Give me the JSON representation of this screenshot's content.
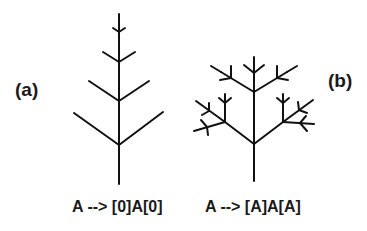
{
  "figure": {
    "panel_a": {
      "label": "(a)",
      "rule": "A --> [0]A[0]"
    },
    "panel_b": {
      "label": "(b)",
      "rule": "A --> [A]A[A]"
    }
  },
  "colors": {
    "stroke": "#111111",
    "text": "#1a1a1a",
    "background": "#ffffff"
  }
}
